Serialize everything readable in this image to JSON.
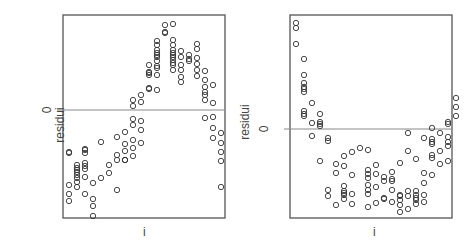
{
  "chart_data": [
    {
      "type": "scatter",
      "title": "",
      "xlabel": "i",
      "ylabel": "residui",
      "yticks": [
        "0"
      ],
      "reference_line": {
        "y": 0,
        "color": "#888888"
      },
      "grid": false,
      "note": "Residuals vs index; inverted-U pattern. Coordinates are in plot-box pixels (x 0-162 left→right, y 0-203 top→bottom), zero line at y=95.",
      "zero_y": 95,
      "points": [
        [
          6,
          137
        ],
        [
          6,
          179
        ],
        [
          6,
          186
        ],
        [
          6,
          170
        ],
        [
          6,
          138
        ],
        [
          14,
          172
        ],
        [
          14,
          167
        ],
        [
          14,
          163
        ],
        [
          14,
          160
        ],
        [
          14,
          157
        ],
        [
          14,
          153
        ],
        [
          14,
          150
        ],
        [
          14,
          155
        ],
        [
          22,
          138
        ],
        [
          22,
          134
        ],
        [
          22,
          154
        ],
        [
          22,
          148
        ],
        [
          22,
          151
        ],
        [
          22,
          162
        ],
        [
          22,
          179
        ],
        [
          22,
          135
        ],
        [
          30,
          168
        ],
        [
          30,
          184
        ],
        [
          30,
          191
        ],
        [
          30,
          201
        ],
        [
          38,
          127
        ],
        [
          38,
          163
        ],
        [
          46,
          150
        ],
        [
          46,
          158
        ],
        [
          54,
          122
        ],
        [
          54,
          140
        ],
        [
          54,
          145
        ],
        [
          54,
          175
        ],
        [
          62,
          117
        ],
        [
          62,
          129
        ],
        [
          62,
          136
        ],
        [
          62,
          145
        ],
        [
          62,
          145
        ],
        [
          70,
          85
        ],
        [
          70,
          91
        ],
        [
          70,
          104
        ],
        [
          70,
          110
        ],
        [
          70,
          125
        ],
        [
          70,
          133
        ],
        [
          70,
          141
        ],
        [
          78,
          80
        ],
        [
          78,
          87
        ],
        [
          78,
          106
        ],
        [
          78,
          115
        ],
        [
          78,
          128
        ],
        [
          86,
          73
        ],
        [
          86,
          74
        ],
        [
          86,
          50
        ],
        [
          86,
          58
        ],
        [
          86,
          57
        ],
        [
          86,
          60
        ],
        [
          94,
          35
        ],
        [
          94,
          42
        ],
        [
          94,
          60
        ],
        [
          94,
          38
        ],
        [
          94,
          40
        ],
        [
          94,
          46
        ],
        [
          94,
          51
        ],
        [
          94,
          53
        ],
        [
          94,
          75
        ],
        [
          94,
          26
        ],
        [
          94,
          30
        ],
        [
          102,
          10
        ],
        [
          102,
          17
        ],
        [
          102,
          18
        ],
        [
          110,
          9
        ],
        [
          110,
          25
        ],
        [
          110,
          30
        ],
        [
          110,
          35
        ],
        [
          110,
          40
        ],
        [
          110,
          45
        ],
        [
          110,
          50
        ],
        [
          110,
          48
        ],
        [
          110,
          38
        ],
        [
          110,
          42
        ],
        [
          110,
          55
        ],
        [
          118,
          36
        ],
        [
          118,
          42
        ],
        [
          118,
          50
        ],
        [
          118,
          55
        ],
        [
          118,
          62
        ],
        [
          118,
          67
        ],
        [
          126,
          40
        ],
        [
          126,
          44
        ],
        [
          126,
          46
        ],
        [
          134,
          29
        ],
        [
          134,
          34
        ],
        [
          134,
          43
        ],
        [
          134,
          49
        ],
        [
          134,
          55
        ],
        [
          134,
          61
        ],
        [
          142,
          56
        ],
        [
          142,
          65
        ],
        [
          142,
          72
        ],
        [
          142,
          77
        ],
        [
          142,
          85
        ],
        [
          142,
          80
        ],
        [
          142,
          103
        ],
        [
          150,
          70
        ],
        [
          150,
          88
        ],
        [
          150,
          102
        ],
        [
          150,
          113
        ],
        [
          150,
          123
        ],
        [
          158,
          137
        ],
        [
          158,
          128
        ],
        [
          158,
          146
        ],
        [
          158,
          172
        ],
        [
          158,
          118
        ]
      ]
    },
    {
      "type": "scatter",
      "title": "",
      "xlabel": "i",
      "ylabel": "residui",
      "yticks": [
        "0"
      ],
      "reference_line": {
        "y": 0,
        "color": "#888888"
      },
      "grid": false,
      "note": "Residuals vs index; U-shaped pattern. Coordinates are in plot-box pixels (x 0-162 left→right, y 0-203 top→bottom), zero line at y=114.",
      "zero_y": 114,
      "points": [
        [
          6,
          8
        ],
        [
          6,
          13
        ],
        [
          6,
          29
        ],
        [
          14,
          44
        ],
        [
          14,
          60
        ],
        [
          14,
          68
        ],
        [
          14,
          72
        ],
        [
          14,
          74
        ],
        [
          14,
          77
        ],
        [
          14,
          96
        ],
        [
          14,
          99
        ],
        [
          14,
          101
        ],
        [
          22,
          88
        ],
        [
          22,
          108
        ],
        [
          22,
          121
        ],
        [
          30,
          99
        ],
        [
          30,
          107
        ],
        [
          30,
          109
        ],
        [
          30,
          111
        ],
        [
          38,
          123
        ],
        [
          38,
          126
        ],
        [
          38,
          175
        ],
        [
          38,
          181
        ],
        [
          30,
          146
        ],
        [
          46,
          149
        ],
        [
          46,
          158
        ],
        [
          46,
          190
        ],
        [
          54,
          141
        ],
        [
          54,
          151
        ],
        [
          54,
          171
        ],
        [
          54,
          176
        ],
        [
          54,
          178
        ],
        [
          54,
          180
        ],
        [
          54,
          184
        ],
        [
          62,
          137
        ],
        [
          62,
          160
        ],
        [
          62,
          179
        ],
        [
          62,
          189
        ],
        [
          70,
          133
        ],
        [
          78,
          135
        ],
        [
          78,
          179
        ],
        [
          78,
          192
        ],
        [
          78,
          155
        ],
        [
          78,
          159
        ],
        [
          78,
          163
        ],
        [
          78,
          170
        ],
        [
          78,
          175
        ],
        [
          86,
          150
        ],
        [
          86,
          159
        ],
        [
          86,
          172
        ],
        [
          86,
          188
        ],
        [
          94,
          162
        ],
        [
          94,
          166
        ],
        [
          94,
          183
        ],
        [
          94,
          184
        ],
        [
          102,
          157
        ],
        [
          102,
          164
        ],
        [
          102,
          166
        ],
        [
          102,
          175
        ],
        [
          102,
          187
        ],
        [
          110,
          148
        ],
        [
          110,
          180
        ],
        [
          110,
          181
        ],
        [
          110,
          185
        ],
        [
          110,
          190
        ],
        [
          110,
          197
        ],
        [
          118,
          118
        ],
        [
          118,
          136
        ],
        [
          118,
          176
        ],
        [
          118,
          181
        ],
        [
          118,
          194
        ],
        [
          126,
          144
        ],
        [
          126,
          176
        ],
        [
          126,
          180
        ],
        [
          126,
          183
        ],
        [
          126,
          185
        ],
        [
          126,
          189
        ],
        [
          134,
          123
        ],
        [
          134,
          158
        ],
        [
          134,
          168
        ],
        [
          134,
          180
        ],
        [
          134,
          187
        ],
        [
          142,
          113
        ],
        [
          142,
          124
        ],
        [
          142,
          127
        ],
        [
          142,
          129
        ],
        [
          142,
          140
        ],
        [
          142,
          143
        ],
        [
          142,
          160
        ],
        [
          150,
          118
        ],
        [
          150,
          136
        ],
        [
          150,
          149
        ],
        [
          158,
          107
        ],
        [
          158,
          109
        ],
        [
          158,
          122
        ],
        [
          158,
          127
        ],
        [
          158,
          131
        ],
        [
          158,
          146
        ],
        [
          166,
          83
        ],
        [
          166,
          101
        ],
        [
          166,
          92
        ]
      ]
    }
  ],
  "panels": [
    {
      "ylabel": "residui",
      "xlabel": "i",
      "ytick": "0"
    },
    {
      "ylabel": "residui",
      "xlabel": "i",
      "ytick": "0"
    }
  ],
  "colors": {
    "axis": "#555555",
    "zero_line": "#888888",
    "marker": "#333333"
  }
}
